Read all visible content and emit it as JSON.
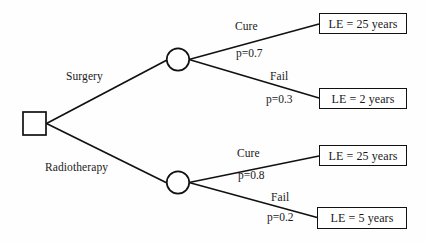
{
  "diagram": {
    "type": "decision-tree",
    "title": "",
    "colors": {
      "background": "#fefefe",
      "stroke": "#111111",
      "text": "#1a1a1a"
    },
    "root": {
      "shape": "square",
      "name": "decision-node",
      "label": ""
    },
    "branches": [
      {
        "id": "surgery",
        "label": "Surgery",
        "chance_node": {
          "shape": "circle",
          "label": ""
        },
        "outcomes": [
          {
            "label": "Cure",
            "probability": "p=0.7",
            "value": "LE = 25 years"
          },
          {
            "label": "Fail",
            "probability": "p=0.3",
            "value": "LE = 2 years"
          }
        ]
      },
      {
        "id": "radiotherapy",
        "label": "Radiotherapy",
        "chance_node": {
          "shape": "circle",
          "label": ""
        },
        "outcomes": [
          {
            "label": "Cure",
            "probability": "p=0.8",
            "value": "LE = 25 years"
          },
          {
            "label": "Fail",
            "probability": "p=0.2",
            "value": "LE = 5 years"
          }
        ]
      }
    ]
  }
}
